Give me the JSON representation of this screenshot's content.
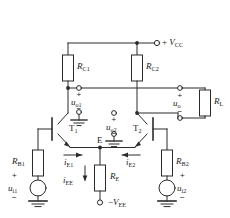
{
  "diagram": {
    "stroke_color": "#2b2b2b",
    "text_color": "#1a1a1a"
  },
  "supplies": {
    "vcc": {
      "label_prefix": "+ ",
      "symbol": "V",
      "sub": "CC",
      "full": "+ VCC"
    },
    "vee": {
      "label_prefix": "−",
      "symbol": "V",
      "sub": "EE",
      "full": "−VEE"
    }
  },
  "resistors": [
    {
      "id": "RC1",
      "symbol": "R",
      "sub": "C1"
    },
    {
      "id": "RC2",
      "symbol": "R",
      "sub": "C2"
    },
    {
      "id": "RB1",
      "symbol": "R",
      "sub": "B1"
    },
    {
      "id": "RB2",
      "symbol": "R",
      "sub": "B2"
    },
    {
      "id": "RE",
      "symbol": "R",
      "sub": "E"
    },
    {
      "id": "RL",
      "symbol": "R",
      "sub": "L"
    }
  ],
  "transistors": [
    {
      "id": "T1",
      "symbol": "T",
      "sub": "1"
    },
    {
      "id": "T2",
      "symbol": "T",
      "sub": "2"
    }
  ],
  "nodes": {
    "emitter": {
      "label": "E"
    }
  },
  "voltages": {
    "uo1": {
      "symbol": "u",
      "sub": "o1",
      "plus": "+",
      "minus": "−"
    },
    "uo2": {
      "symbol": "u",
      "sub": "o2",
      "plus": "+",
      "minus": "−"
    },
    "uo": {
      "symbol": "u",
      "sub": "o",
      "plus": "+",
      "minus": "−"
    },
    "ui1": {
      "symbol": "u",
      "sub": "i1",
      "plus": "+",
      "minus": "−"
    },
    "ui2": {
      "symbol": "u",
      "sub": "i2",
      "plus": "+",
      "minus": "−"
    }
  },
  "currents": [
    {
      "id": "iE1",
      "symbol": "i",
      "sub": "E1",
      "direction": "right"
    },
    {
      "id": "iE2",
      "symbol": "i",
      "sub": "E2",
      "direction": "left"
    },
    {
      "id": "iEE",
      "symbol": "i",
      "sub": "EE",
      "direction": "down"
    }
  ]
}
